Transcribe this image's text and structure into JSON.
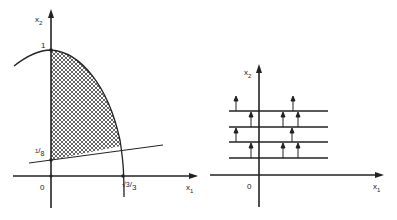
{
  "left_panel": {
    "y_axis_label": "x",
    "y_axis_sub": "2",
    "x_axis_label": "x",
    "x_axis_sub": "1",
    "origin_label": "0",
    "tick_top": "1",
    "tick_low_num": "1",
    "tick_low_den": "8",
    "tick_x": "√3",
    "tick_x_den": "3"
  },
  "right_panel": {
    "y_axis_label": "x",
    "y_axis_sub": "2",
    "x_axis_label": "x",
    "x_axis_sub": "1",
    "origin_label": "0"
  }
}
